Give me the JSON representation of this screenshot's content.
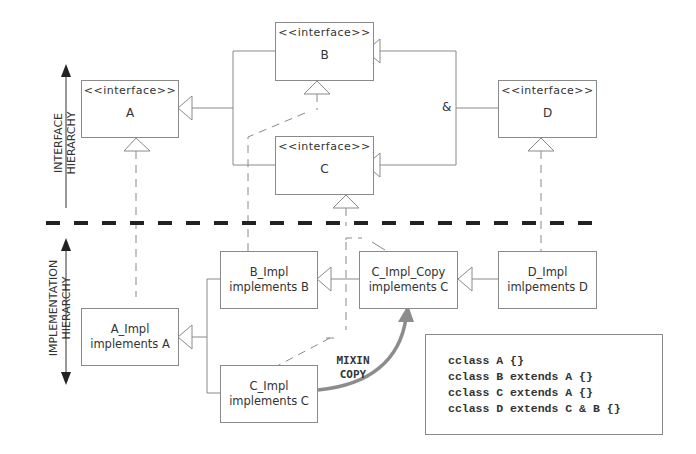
{
  "axis_labels": {
    "interface": [
      "INTERFACE",
      "HIERARCHY"
    ],
    "implementation": [
      "IMPLEMENTATION",
      "HIERARCHY"
    ]
  },
  "interfaces": {
    "stereotype": "<<interface>>",
    "A": "A",
    "B": "B",
    "C": "C",
    "D": "D"
  },
  "ampersand": "&",
  "implementations": {
    "A": {
      "name": "A_Impl",
      "desc": "implements A"
    },
    "B": {
      "name": "B_Impl",
      "desc": "implements B"
    },
    "C": {
      "name": "C_Impl",
      "desc": "implements C"
    },
    "C_copy": {
      "name": "C_Impl_Copy",
      "desc": "implements C"
    },
    "D": {
      "name": "D_Impl",
      "desc": "imlpements D"
    }
  },
  "mixin_label": [
    "MIXIN",
    "COPY"
  ],
  "code_lines": [
    "cclass A {}",
    "cclass B extends A {}",
    "cclass C extends A {}",
    "cclass D extends C & B {}"
  ],
  "colors": {
    "line": "#8a8a8a",
    "divider": "#222222",
    "mixin_arrow": "#8c8c8c"
  }
}
